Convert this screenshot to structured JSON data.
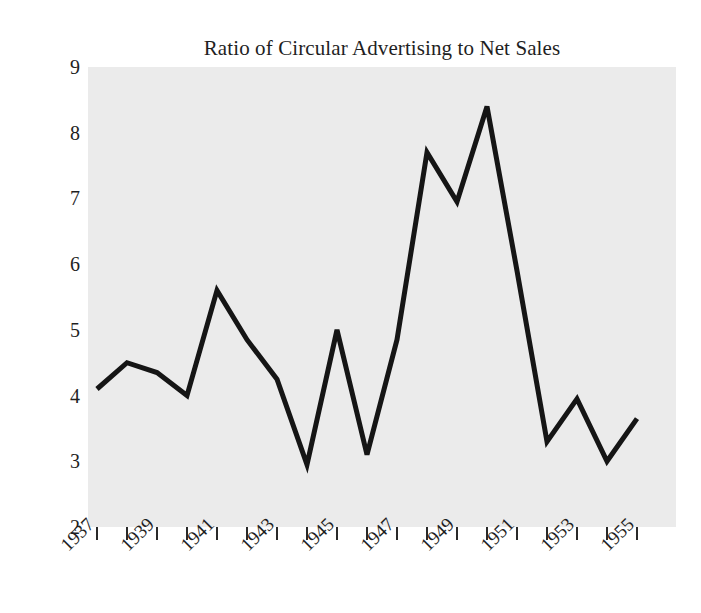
{
  "chart_data": {
    "type": "line",
    "title": "Ratio of Circular Advertising to Net Sales",
    "xlabel": "",
    "ylabel": "Percent of Net Sales",
    "x": [
      1937,
      1938,
      1939,
      1940,
      1941,
      1942,
      1943,
      1944,
      1945,
      1946,
      1947,
      1948,
      1949,
      1950,
      1951,
      1952,
      1953,
      1954,
      1955
    ],
    "values": [
      4.1,
      4.5,
      4.35,
      4.0,
      5.6,
      4.85,
      4.25,
      2.95,
      5.0,
      3.1,
      4.85,
      7.7,
      6.95,
      8.4,
      5.9,
      3.3,
      3.95,
      3.0,
      3.65
    ],
    "series": [
      {
        "name": "Percent of Net Sales",
        "values": [
          4.1,
          4.5,
          4.35,
          4.0,
          5.6,
          4.85,
          4.25,
          2.95,
          5.0,
          3.1,
          4.85,
          7.7,
          6.95,
          8.4,
          5.9,
          3.3,
          3.95,
          3.0,
          3.65
        ]
      }
    ],
    "xlim": [
      1936.7,
      1956.3
    ],
    "ylim": [
      2,
      9
    ],
    "y_ticks": [
      9,
      8,
      7,
      6,
      5,
      4,
      3,
      2
    ],
    "x_ticks": [
      1937,
      1938,
      1939,
      1940,
      1941,
      1942,
      1943,
      1944,
      1945,
      1946,
      1947,
      1948,
      1949,
      1950,
      1951,
      1952,
      1953,
      1954,
      1955
    ],
    "x_tick_labels": [
      "1937",
      "",
      "1939",
      "",
      "1941",
      "",
      "1943",
      "",
      "1945",
      "",
      "1947",
      "",
      "1949",
      "",
      "1951",
      "",
      "1953",
      "",
      "1955"
    ],
    "grid": false,
    "legend": false,
    "line_color": "#151515",
    "line_width": 5,
    "plot_background": "#ebebeb",
    "figure_background": "#ffffff",
    "text_color": "#1f1f1f"
  }
}
